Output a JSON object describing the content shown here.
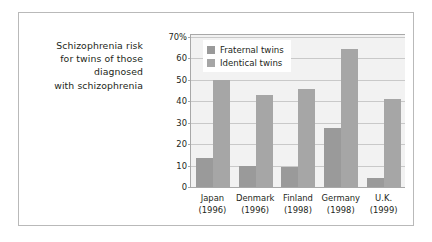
{
  "caption": {
    "lines": [
      "Schizophrenia risk",
      "for twins of those",
      "diagnosed",
      "with schizophrenia"
    ]
  },
  "colors": {
    "fraternal": "#9a9a9a",
    "identical": "#a6a6a6",
    "plot_background": "#f2f2f2",
    "gridline": "#c9c9c9",
    "axis": "#a8a8a8",
    "frame_border": "#b9b9b9",
    "text": "#231f20"
  },
  "chart_data": {
    "type": "bar",
    "title": "",
    "xlabel": "",
    "ylabel": "",
    "ylim": [
      0,
      70.8
    ],
    "grid": true,
    "legend_position": "top-left",
    "ytick_values": [
      0,
      10,
      20,
      30,
      40,
      50,
      60,
      70
    ],
    "ytick_labels": [
      "0",
      "10",
      "20",
      "30",
      "40",
      "50",
      "60",
      "70%"
    ],
    "categories": [
      "Japan",
      "Denmark",
      "Finland",
      "Germany",
      "U.K."
    ],
    "category_years": [
      "(1996)",
      "(1996)",
      "(1998)",
      "(1998)",
      "(1999)"
    ],
    "series": [
      {
        "name": "Fraternal twins",
        "values": [
          13.5,
          10,
          9.5,
          27.5,
          4
        ]
      },
      {
        "name": "Identical twins",
        "values": [
          50,
          43,
          45.5,
          64.5,
          41
        ]
      }
    ]
  }
}
